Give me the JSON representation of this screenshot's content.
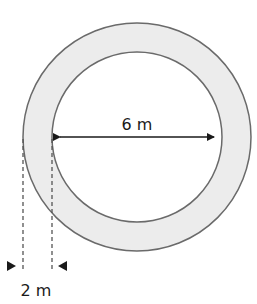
{
  "diagram": {
    "type": "annulus-dimension",
    "colors": {
      "ring_fill": "#ececec",
      "outline": "#6a6a6a",
      "inner_fill": "#ffffff",
      "arrow": "#1a1a1a",
      "dash": "#555555"
    },
    "outer_circle": {
      "cx": 137,
      "cy": 137,
      "r": 114
    },
    "inner_circle": {
      "cx": 137,
      "cy": 137,
      "r": 85
    },
    "labels": {
      "inner_diameter": "6 m",
      "ring_width": "2 m"
    }
  }
}
